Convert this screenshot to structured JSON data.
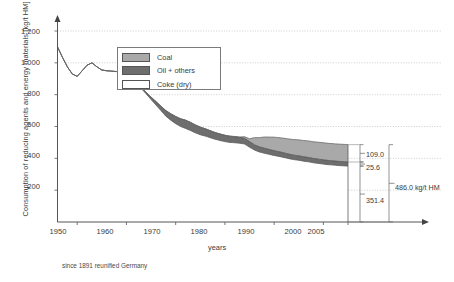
{
  "chart_data": {
    "type": "area",
    "title": "",
    "xlabel": "years",
    "ylabel": "Consumption of reducing agents and energy materials [kg/t HM]",
    "xlim": [
      1946,
      2008
    ],
    "ylim": [
      0,
      1300
    ],
    "grid": true,
    "stacked": true,
    "legend_position": "top-center-inside",
    "footnote": "since 1891 reunified Germany",
    "y_ticks": [
      "200",
      "400",
      "600",
      "800",
      "1.000",
      "1.200"
    ],
    "y_tick_values": [
      200,
      400,
      600,
      800,
      1000,
      1200
    ],
    "x_ticks": [
      "1950",
      "1960",
      "1970",
      "1980",
      "1990",
      "2000",
      "2005"
    ],
    "x_tick_values": [
      1950,
      1960,
      1970,
      1980,
      1990,
      2000,
      2005
    ],
    "series": [
      {
        "name": "Coke (dry)",
        "color": "#ffffff",
        "x": [
          1946,
          1947,
          1948,
          1949,
          1950,
          1951,
          1952,
          1953,
          1954,
          1955,
          1956,
          1957,
          1958,
          1959,
          1960,
          1961,
          1962,
          1963,
          1964,
          1965,
          1966,
          1967,
          1968,
          1969,
          1970,
          1971,
          1972,
          1973,
          1974,
          1975,
          1976,
          1977,
          1978,
          1979,
          1980,
          1981,
          1982,
          1983,
          1984,
          1985,
          1986,
          1987,
          1988,
          1989,
          1990,
          1991,
          1992,
          1993,
          1994,
          1995,
          1996,
          1997,
          1998,
          1999,
          2000,
          2001,
          2002,
          2003,
          2004,
          2005
        ],
        "values": [
          1100,
          1035,
          975,
          930,
          915,
          950,
          985,
          1000,
          975,
          955,
          950,
          948,
          945,
          940,
          940,
          900,
          870,
          840,
          805,
          770,
          735,
          700,
          665,
          640,
          618,
          600,
          588,
          575,
          560,
          548,
          540,
          530,
          520,
          512,
          505,
          500,
          498,
          495,
          490,
          470,
          452,
          440,
          432,
          425,
          418,
          412,
          405,
          398,
          392,
          388,
          382,
          378,
          372,
          368,
          364,
          360,
          358,
          355,
          353,
          351.4
        ]
      },
      {
        "name": "Oil + others",
        "color": "#6e6e6e",
        "x": [
          1946,
          1955,
          1960,
          1963,
          1965,
          1967,
          1968,
          1970,
          1972,
          1974,
          1976,
          1978,
          1980,
          1982,
          1984,
          1985,
          1986,
          1988,
          1990,
          1992,
          1994,
          1996,
          1998,
          2000,
          2002,
          2004,
          2005
        ],
        "values": [
          0,
          0,
          0,
          5,
          15,
          28,
          35,
          45,
          52,
          50,
          46,
          42,
          40,
          38,
          36,
          35,
          33,
          32,
          30,
          29,
          28,
          28,
          27,
          27,
          26,
          26,
          25.6
        ]
      },
      {
        "name": "Coal",
        "color": "#a9a9a9",
        "x": [
          1946,
          1980,
          1983,
          1985,
          1986,
          1988,
          1990,
          1992,
          1994,
          1996,
          1998,
          2000,
          2002,
          2004,
          2005
        ],
        "values": [
          0,
          0,
          2,
          18,
          45,
          70,
          85,
          92,
          98,
          102,
          105,
          107,
          108,
          109,
          109.0
        ]
      }
    ],
    "end_annotations": {
      "coal_value": "109.0",
      "oil_value": "25.6",
      "coke_value": "351.4",
      "total_value": "486.0 kg/t HM"
    }
  },
  "legend": {
    "items": [
      {
        "label": "Coal",
        "color": "#a9a9a9"
      },
      {
        "label": "Oil + others",
        "color": "#6e6e6e"
      },
      {
        "label": "Coke (dry)",
        "color": "#ffffff"
      }
    ]
  },
  "axes": {
    "y_title": "Consumption of reducing agents and energy materials [kg/t HM]",
    "x_title": "years",
    "y_ticks": [
      "1.200",
      "1.000",
      "800",
      "600",
      "400",
      "200"
    ],
    "x_ticks": [
      "1950",
      "1960",
      "1970",
      "1980",
      "1990",
      "2000",
      "2005"
    ]
  },
  "annotations": {
    "coal": "109.0",
    "oil": "25.6",
    "coke": "351.4",
    "total": "486.0 kg/t HM"
  },
  "footnote": "since 1891 reunified Germany"
}
